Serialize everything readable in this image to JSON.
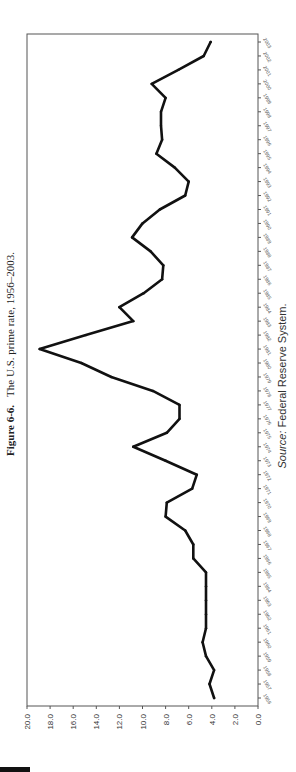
{
  "figure": {
    "label": "Figure 6-6.",
    "caption": "The U.S. prime rate, 1956–2003.",
    "source_prefix": "Source:",
    "source_text": " Federal Reserve System."
  },
  "chart_data": {
    "type": "line",
    "title": "The U.S. prime rate, 1956–2003.",
    "xlabel": "",
    "ylabel": "",
    "orientation": "rotated-90-counterclockwise",
    "ylim": [
      0,
      20
    ],
    "yticks": [
      "0.0",
      "2.0",
      "4.0",
      "6.0",
      "8.0",
      "10.0",
      "12.0",
      "14.0",
      "16.0",
      "18.0",
      "20.0"
    ],
    "grid": false,
    "legend": "none",
    "x": [
      1956,
      1957,
      1958,
      1959,
      1960,
      1961,
      1962,
      1963,
      1964,
      1965,
      1966,
      1967,
      1968,
      1969,
      1970,
      1971,
      1972,
      1973,
      1974,
      1975,
      1976,
      1977,
      1978,
      1979,
      1980,
      1981,
      1982,
      1983,
      1984,
      1985,
      1986,
      1987,
      1988,
      1989,
      1990,
      1991,
      1992,
      1993,
      1994,
      1995,
      1996,
      1997,
      1998,
      1999,
      2000,
      2001,
      2002,
      2003
    ],
    "series": [
      {
        "name": "Prime rate",
        "values": [
          3.8,
          4.2,
          3.8,
          4.5,
          4.8,
          4.5,
          4.5,
          4.5,
          4.5,
          4.5,
          5.6,
          5.6,
          6.3,
          8.0,
          7.9,
          5.7,
          5.3,
          8.0,
          10.8,
          7.9,
          6.8,
          6.8,
          9.1,
          12.7,
          15.3,
          18.9,
          14.9,
          10.8,
          12.0,
          9.9,
          8.3,
          8.2,
          9.3,
          10.9,
          10.0,
          8.5,
          6.3,
          6.0,
          7.2,
          8.8,
          8.3,
          8.4,
          8.4,
          8.0,
          9.2,
          6.9,
          4.7,
          4.1
        ]
      }
    ]
  },
  "colors": {
    "line": "#111111",
    "frame": "#555555",
    "text": "#222222"
  }
}
